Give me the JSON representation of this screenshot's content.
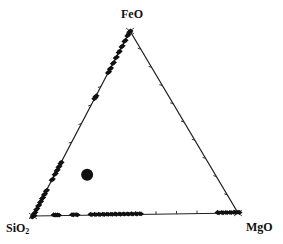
{
  "diagram": {
    "type": "ternary",
    "vertices": {
      "top": {
        "label": "FeO"
      },
      "left": {
        "label": "SiO",
        "subscript": "2"
      },
      "right": {
        "label": "MgO"
      }
    },
    "tick_interval_percent": 10,
    "colors": {
      "line": "#222222",
      "points": "#111111",
      "background": "#ffffff"
    }
  },
  "chart_data": {
    "type": "scatter",
    "subtype": "ternary",
    "title": "",
    "components": [
      "SiO2",
      "FeO",
      "MgO"
    ],
    "axis_labels": {
      "top": "FeO",
      "bottom_left": "SiO2",
      "bottom_right": "MgO"
    },
    "ticks": "every 10% on all three edges",
    "grid": false,
    "series": [
      {
        "name": "SiO2-FeO join",
        "marker": "small filled diamond",
        "points_feo_percent": [
          100,
          98,
          95,
          92,
          89,
          86,
          83,
          80,
          78,
          65,
          64,
          29,
          27,
          25,
          23,
          20,
          14,
          12,
          10,
          8,
          6,
          4,
          2,
          0
        ]
      },
      {
        "name": "SiO2-MgO join",
        "marker": "small filled diamond",
        "points_mgo_percent": [
          0,
          10,
          11,
          12,
          19,
          21,
          28,
          30,
          32,
          34,
          36,
          38,
          40,
          42,
          44,
          46,
          48,
          50,
          52,
          90,
          92,
          94,
          96,
          98,
          100
        ]
      },
      {
        "name": "Interior point",
        "marker": "large filled circle",
        "points": [
          {
            "SiO2": 62,
            "FeO": 22,
            "MgO": 16
          }
        ]
      }
    ]
  }
}
